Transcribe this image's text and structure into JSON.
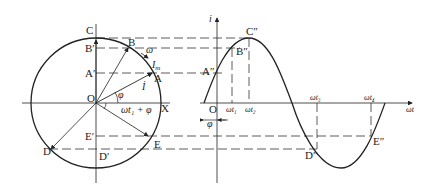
{
  "diagram": {
    "phasor_diagram": {
      "center_label": "O",
      "axis_x_label": "X",
      "points": [
        "A",
        "B",
        "C",
        "D",
        "E"
      ],
      "projections": [
        "A′",
        "B′",
        "C",
        "D′",
        "E′"
      ],
      "angular_velocity_label": "ω",
      "amplitude_label": "I",
      "amplitude_sub": "m",
      "phasor_label": "İ",
      "phase_angle_label": "φ",
      "angle_label": "ωt₁ + φ"
    },
    "waveform": {
      "y_axis_label": "i",
      "x_axis_label": "ωt",
      "origin_label": "O",
      "phase_offset_label": "φ",
      "points": [
        "A″",
        "B″",
        "C″",
        "D″",
        "E″"
      ],
      "ticks": [
        "ωt₁",
        "ωt₂",
        "ωt₃",
        "ωt₄"
      ]
    },
    "colors": {
      "stroke": "#222222",
      "background": "#ffffff"
    }
  }
}
